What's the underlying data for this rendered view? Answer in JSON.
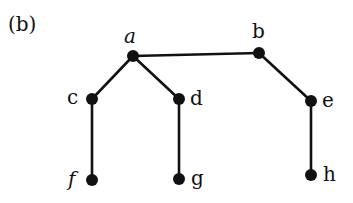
{
  "figure_label": "(b)",
  "graph": {
    "type": "tree",
    "nodes": [
      {
        "id": "a",
        "label": "a",
        "x": 133,
        "y": 56,
        "lx": 124,
        "ly": 26,
        "italic": true
      },
      {
        "id": "b",
        "label": "b",
        "x": 259,
        "y": 53,
        "lx": 252,
        "ly": 21,
        "italic": false
      },
      {
        "id": "c",
        "label": "c",
        "x": 92,
        "y": 99,
        "lx": 67,
        "ly": 87,
        "italic": false
      },
      {
        "id": "d",
        "label": "d",
        "x": 179,
        "y": 99,
        "lx": 190,
        "ly": 88,
        "italic": false
      },
      {
        "id": "e",
        "label": "e",
        "x": 311,
        "y": 101,
        "lx": 322,
        "ly": 90,
        "italic": false
      },
      {
        "id": "f",
        "label": "f",
        "x": 92,
        "y": 180,
        "lx": 68,
        "ly": 169,
        "italic": true
      },
      {
        "id": "g",
        "label": "g",
        "x": 179,
        "y": 179,
        "lx": 191,
        "ly": 168,
        "italic": false
      },
      {
        "id": "h",
        "label": "h",
        "x": 311,
        "y": 175,
        "lx": 323,
        "ly": 164,
        "italic": false
      }
    ],
    "edges": [
      [
        "a",
        "b"
      ],
      [
        "a",
        "c"
      ],
      [
        "a",
        "d"
      ],
      [
        "b",
        "e"
      ],
      [
        "c",
        "f"
      ],
      [
        "d",
        "g"
      ],
      [
        "e",
        "h"
      ]
    ],
    "node_color": "#111111",
    "edge_color": "#111111"
  }
}
